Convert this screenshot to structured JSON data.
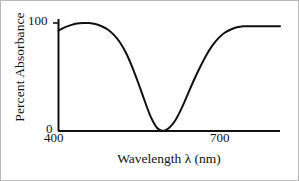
{
  "figure": {
    "background_color": "#ffffff",
    "ink_color": "#111111",
    "border_color": "#b9b9b9"
  },
  "chart_data": {
    "type": "line",
    "title": "",
    "subtitle": "",
    "xlabel": "Wavelength λ (nm)",
    "ylabel": "Percent Absorbance",
    "xlim": [
      400,
      760
    ],
    "ylim": [
      0,
      105
    ],
    "xticks": [
      400,
      700
    ],
    "xtick_labels": [
      "400",
      "700"
    ],
    "yticks": [
      0,
      100
    ],
    "ytick_labels": [
      "0",
      "100"
    ],
    "grid": false,
    "legend": null,
    "legend_position": "none",
    "annotations": [],
    "series": [
      {
        "name": "Percent Absorbance",
        "color": "#111111",
        "line_width": 2,
        "x": [
          400,
          410,
          420,
          430,
          440,
          450,
          460,
          470,
          480,
          490,
          500,
          510,
          520,
          530,
          540,
          550,
          560,
          570,
          580,
          590,
          600,
          610,
          620,
          630,
          640,
          650,
          660,
          670,
          680,
          690,
          700,
          710,
          720,
          730,
          740,
          750,
          760
        ],
        "values": [
          93,
          96,
          98,
          99.5,
          100,
          100,
          99,
          97,
          94,
          89,
          82,
          72,
          59,
          44,
          28,
          13,
          3,
          0,
          3,
          10,
          21,
          34,
          47,
          59,
          70,
          79,
          86,
          91,
          94,
          96,
          97,
          97,
          97,
          97,
          97,
          97,
          97
        ]
      }
    ]
  },
  "axis_labels": {
    "y_max": "100",
    "y_min": "0",
    "x_min": "400",
    "x_max": "700"
  }
}
